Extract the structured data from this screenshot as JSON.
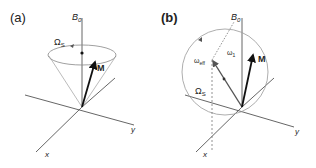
{
  "figure": {
    "panels": [
      {
        "id": "a",
        "label": "(a)",
        "field_label": "B",
        "field_sub": "0",
        "precession_label": "Ω",
        "precession_sub": "S",
        "vector_label": "M",
        "x_label": "x",
        "y_label": "y"
      },
      {
        "id": "b",
        "label": "(b)",
        "field_label": "B",
        "field_sub": "0",
        "precession_label": "Ω",
        "precession_sub": "S",
        "eff_label": "ω",
        "eff_sub": "eff",
        "w1_label": "ω",
        "w1_sub": "1",
        "vector_label": "M",
        "x_label": "x",
        "y_label": "y"
      }
    ],
    "colors": {
      "axis": "#555555",
      "cone": "#aaaaaa",
      "vector": "#111111",
      "eff_vector": "#444444"
    }
  }
}
